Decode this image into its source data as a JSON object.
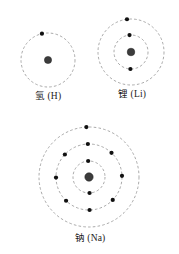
{
  "figure": {
    "title": "",
    "background_color": "#ffffff",
    "shell_color": "#8d8d8d",
    "electron_color": "#111111",
    "nucleus_color": "#3c3c3c"
  },
  "atoms": [
    {
      "id": "hydrogen",
      "label": "氢 (H)",
      "element_symbol": "H",
      "chinese_name": "氢",
      "nucleus": {
        "cx": 48,
        "cy": 46,
        "r": 3.6
      },
      "shells": [
        {
          "index": 1,
          "radius": 27,
          "electron_count": 1,
          "electron_angles_deg": [
            103
          ]
        }
      ]
    },
    {
      "id": "lithium",
      "label": "锂 (Li)",
      "element_symbol": "Li",
      "chinese_name": "锂",
      "nucleus": {
        "cx": 43,
        "cy": 44,
        "r": 3.8
      },
      "shells": [
        {
          "index": 1,
          "radius": 17,
          "electron_count": 2,
          "electron_angles_deg": [
            95,
            268
          ]
        },
        {
          "index": 2,
          "radius": 33,
          "electron_count": 1,
          "electron_angles_deg": [
            97
          ]
        }
      ]
    },
    {
      "id": "sodium",
      "label": "钠 (Na)",
      "element_symbol": "Na",
      "chinese_name": "钠",
      "nucleus": {
        "cx": 65,
        "cy": 59,
        "r": 4.2
      },
      "shells": [
        {
          "index": 1,
          "radius": 16,
          "electron_count": 2,
          "electron_angles_deg": [
            93,
            272
          ]
        },
        {
          "index": 2,
          "radius": 33,
          "electron_count": 8,
          "electron_angles_deg": [
            92,
            47,
            2,
            316,
            271,
            226,
            181,
            137
          ]
        },
        {
          "index": 3,
          "radius": 50,
          "electron_count": 1,
          "electron_angles_deg": [
            93
          ]
        }
      ]
    }
  ]
}
